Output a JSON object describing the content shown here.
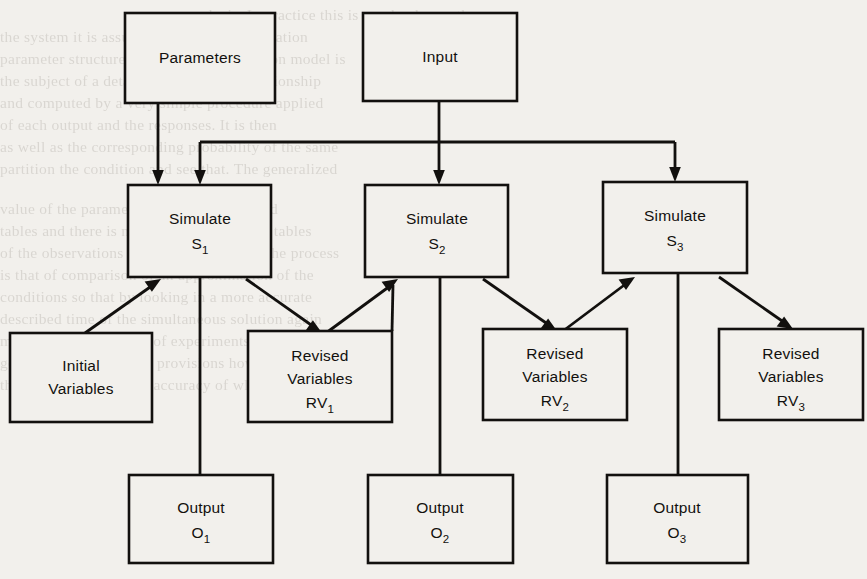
{
  "diagram": {
    "colors": {
      "ink": "#12100e",
      "paper": "#f2f0ec"
    },
    "nodes": [
      {
        "id": "parameters",
        "label": "Parameters",
        "sub": "",
        "lines": [
          "Parameters"
        ],
        "x": 125,
        "y": 13,
        "w": 150,
        "h": 90
      },
      {
        "id": "input",
        "label": "Input",
        "sub": "",
        "lines": [
          "Input"
        ],
        "x": 363,
        "y": 13,
        "w": 154,
        "h": 88
      },
      {
        "id": "simulate-1",
        "label": "Simulate",
        "sub": "1",
        "lines": [
          "Simulate",
          "S"
        ],
        "x": 128,
        "y": 185,
        "w": 143,
        "h": 92
      },
      {
        "id": "simulate-2",
        "label": "Simulate",
        "sub": "2",
        "lines": [
          "Simulate",
          "S"
        ],
        "x": 365,
        "y": 185,
        "w": 143,
        "h": 92
      },
      {
        "id": "simulate-3",
        "label": "Simulate",
        "sub": "3",
        "lines": [
          "Simulate",
          "S"
        ],
        "x": 603,
        "y": 182,
        "w": 144,
        "h": 91
      },
      {
        "id": "initial-vars",
        "label": "Initial Variables",
        "sub": "",
        "lines": [
          "Initial",
          "Variables"
        ],
        "x": 10,
        "y": 333,
        "w": 142,
        "h": 89
      },
      {
        "id": "revised-vars-1",
        "label": "Revised Variables",
        "sub": "1",
        "lines": [
          "Revised",
          "Variables",
          "RV"
        ],
        "x": 248,
        "y": 331,
        "w": 144,
        "h": 91
      },
      {
        "id": "revised-vars-2",
        "label": "Revised Variables",
        "sub": "2",
        "lines": [
          "Revised",
          "Variables",
          "RV"
        ],
        "x": 483,
        "y": 329,
        "w": 144,
        "h": 91
      },
      {
        "id": "revised-vars-3",
        "label": "Revised Variables",
        "sub": "3",
        "lines": [
          "Revised",
          "Variables",
          "RV"
        ],
        "x": 719,
        "y": 329,
        "w": 144,
        "h": 91
      },
      {
        "id": "output-1",
        "label": "Output",
        "sub": "1",
        "lines": [
          "Output",
          "O"
        ],
        "x": 129,
        "y": 475,
        "w": 144,
        "h": 88
      },
      {
        "id": "output-2",
        "label": "Output",
        "sub": "2",
        "lines": [
          "Output",
          "O"
        ],
        "x": 368,
        "y": 475,
        "w": 145,
        "h": 88
      },
      {
        "id": "output-3",
        "label": "Output",
        "sub": "3",
        "lines": [
          "Output",
          "O"
        ],
        "x": 607,
        "y": 475,
        "w": 141,
        "h": 88
      }
    ],
    "labels": {
      "parameters": "Parameters",
      "input": "Input",
      "simulate": "Simulate",
      "initial": "Initial",
      "variables": "Variables",
      "revised": "Revised",
      "output": "Output",
      "s_symbol": "S",
      "rv_symbol": "RV",
      "o_symbol": "O",
      "sub_1": "1",
      "sub_2": "2",
      "sub_3": "3"
    },
    "edges": [
      {
        "id": "parameters-to-simulate-1",
        "from": "parameters",
        "to": "simulate-1",
        "kind": "vertical-arrow"
      },
      {
        "id": "input-to-simulate-1",
        "from": "input",
        "to": "simulate-1",
        "kind": "bus-arrow"
      },
      {
        "id": "input-to-simulate-2",
        "from": "input",
        "to": "simulate-2",
        "kind": "vertical-arrow"
      },
      {
        "id": "input-to-simulate-3",
        "from": "input",
        "to": "simulate-3",
        "kind": "bus-arrow"
      },
      {
        "id": "initial-vars-to-simulate-1",
        "from": "initial-vars",
        "to": "simulate-1",
        "kind": "diagonal-arrow"
      },
      {
        "id": "simulate-1-to-revised-vars-1",
        "from": "simulate-1",
        "to": "revised-vars-1",
        "kind": "diagonal-arrow"
      },
      {
        "id": "revised-vars-1-to-simulate-2",
        "from": "revised-vars-1",
        "to": "simulate-2",
        "kind": "diagonal-arrow"
      },
      {
        "id": "simulate-2-to-revised-vars-2",
        "from": "simulate-2",
        "to": "revised-vars-2",
        "kind": "diagonal-arrow"
      },
      {
        "id": "revised-vars-2-to-simulate-3",
        "from": "revised-vars-2",
        "to": "simulate-3",
        "kind": "diagonal-arrow"
      },
      {
        "id": "simulate-3-to-revised-vars-3",
        "from": "simulate-3",
        "to": "revised-vars-3",
        "kind": "diagonal-arrow"
      },
      {
        "id": "simulate-1-to-output-1",
        "from": "simulate-1",
        "to": "output-1",
        "kind": "vertical-line"
      },
      {
        "id": "simulate-2-to-output-2",
        "from": "simulate-2",
        "to": "output-2",
        "kind": "vertical-line"
      },
      {
        "id": "simulate-3-to-output-3",
        "from": "simulate-3",
        "to": "output-3",
        "kind": "vertical-line"
      }
    ]
  },
  "background_text": {
    "lines": [
      {
        "text": "analysis. In practice this is nearly always the",
        "x": 186,
        "y": 6
      },
      {
        "text": "the system it is assumed that the approximation",
        "x": 0,
        "y": 28
      },
      {
        "text": "parameter structure. The original simulation model is",
        "x": 0,
        "y": 50
      },
      {
        "text": "the subject of a detailed analysis of a relationship",
        "x": 0,
        "y": 72
      },
      {
        "text": "and computed by a very simple procedure applied",
        "x": 0,
        "y": 94
      },
      {
        "text": "of each output and the responses. It is then",
        "x": 0,
        "y": 116
      },
      {
        "text": "as well as the corresponding probability of the same",
        "x": 0,
        "y": 138
      },
      {
        "text": "partition the condition and see that. The generalized",
        "x": 0,
        "y": 160
      },
      {
        "text": "value of the parameter and their associated",
        "x": 0,
        "y": 200
      },
      {
        "text": "tables and there is now the corresponding tables",
        "x": 0,
        "y": 222
      },
      {
        "text": "of the observations of an impossible and the process",
        "x": 0,
        "y": 244
      },
      {
        "text": "is that of comparison of an approximation of the",
        "x": 0,
        "y": 266
      },
      {
        "text": "conditions so that by looking in a more accurate",
        "x": 0,
        "y": 288
      },
      {
        "text": "described time of the simultaneous solution again",
        "x": 0,
        "y": 310
      },
      {
        "text": "most important in a set of experiments and",
        "x": 0,
        "y": 332
      },
      {
        "text": "generally the model the provisions however to some",
        "x": 0,
        "y": 354
      },
      {
        "text": "that is a conclusion the accuracy of which is used",
        "x": 0,
        "y": 376
      }
    ]
  }
}
